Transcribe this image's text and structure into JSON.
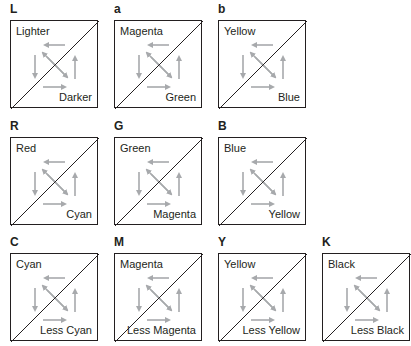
{
  "panels": [
    {
      "letter": "L",
      "top_label": "Lighter",
      "bottom_label": "Darker"
    },
    {
      "letter": "a",
      "top_label": "Magenta",
      "bottom_label": "Green"
    },
    {
      "letter": "b",
      "top_label": "Yellow",
      "bottom_label": "Blue"
    },
    {
      "letter": "R",
      "top_label": "Red",
      "bottom_label": "Cyan"
    },
    {
      "letter": "G",
      "top_label": "Green",
      "bottom_label": "Magenta"
    },
    {
      "letter": "B",
      "top_label": "Blue",
      "bottom_label": "Yellow"
    },
    {
      "letter": "C",
      "top_label": "Cyan",
      "bottom_label": "Less Cyan"
    },
    {
      "letter": "M",
      "top_label": "Magenta",
      "bottom_label": "Less Magenta"
    },
    {
      "letter": "Y",
      "top_label": "Yellow",
      "bottom_label": "Less Yellow"
    },
    {
      "letter": "K",
      "top_label": "Black",
      "bottom_label": "Less Black"
    }
  ],
  "colors": {
    "line": "#231f20",
    "arrow": "#a7a9ac"
  }
}
